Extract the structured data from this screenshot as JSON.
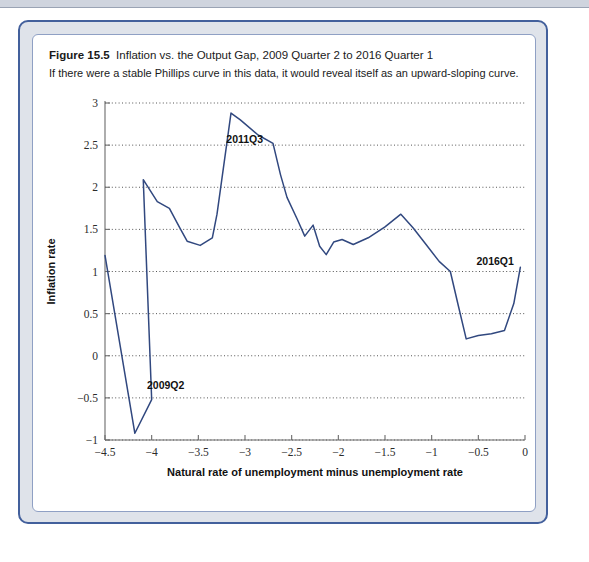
{
  "figure": {
    "number": "Figure 15.5",
    "title": "Inflation vs. the Output Gap, 2009 Quarter 2 to 2016 Quarter 1",
    "subtitle": "If there were a stable Phillips curve in this data, it would reveal itself as an upward-sloping curve."
  },
  "colors": {
    "series": "#31487f",
    "frame_border": "#43609c",
    "panel_background": "#dfe3ea",
    "plot_background": "#ffffff",
    "gridline": "#555555",
    "axis": "#6b6b6b"
  },
  "chart_data": {
    "type": "line",
    "title": "Inflation vs. the Output Gap, 2009 Quarter 2 to 2016 Quarter 1",
    "xlabel": "Natural rate of unemployment minus unemployment rate",
    "ylabel": "Inflation rate",
    "xlim": [
      -4.5,
      0
    ],
    "ylim": [
      -1,
      3
    ],
    "xticks": [
      -4.5,
      -4,
      -3.5,
      -3,
      -2.5,
      -2,
      -1.5,
      -1,
      -0.5,
      0
    ],
    "xticklabels": [
      "−4.5",
      "−4",
      "−3.5",
      "−3",
      "−2.5",
      "−2",
      "−1.5",
      "−1",
      "−0.5",
      "0"
    ],
    "yticks": [
      -1,
      -0.5,
      0,
      0.5,
      1,
      1.5,
      2,
      2.5,
      3
    ],
    "yticklabels": [
      "−1",
      "−0.5",
      "0",
      "0.5",
      "1",
      "1.5",
      "2",
      "2.5",
      "3"
    ],
    "grid": "horizontal",
    "legend": "none",
    "series": [
      {
        "name": "Inflation vs. output gap path",
        "x": [
          -4.5,
          -4.18,
          -4.0,
          -4.09,
          -3.94,
          -3.81,
          -3.7,
          -3.62,
          -3.48,
          -3.35,
          -3.3,
          -3.15,
          -3.05,
          -2.86,
          -2.7,
          -2.62,
          -2.55,
          -2.44,
          -2.36,
          -2.27,
          -2.2,
          -2.13,
          -2.05,
          -1.96,
          -1.84,
          -1.68,
          -1.5,
          -1.33,
          -1.2,
          -1.06,
          -0.92,
          -0.8,
          -0.72,
          -0.63,
          -0.5,
          -0.36,
          -0.22,
          -0.12,
          -0.05
        ],
        "y": [
          1.19,
          -0.92,
          -0.52,
          2.09,
          1.83,
          1.75,
          1.52,
          1.36,
          1.31,
          1.4,
          1.68,
          2.88,
          2.8,
          2.62,
          2.52,
          2.15,
          1.88,
          1.62,
          1.42,
          1.55,
          1.3,
          1.2,
          1.35,
          1.38,
          1.32,
          1.4,
          1.53,
          1.68,
          1.52,
          1.32,
          1.12,
          1.0,
          0.62,
          0.2,
          0.24,
          0.26,
          0.3,
          0.62,
          1.05
        ]
      }
    ],
    "annotations": [
      {
        "text": "2009Q2",
        "x": -4.05,
        "y": -0.4,
        "anchor": "start"
      },
      {
        "text": "2011Q3",
        "x": -3.2,
        "y": 2.52,
        "anchor": "start"
      },
      {
        "text": "2016Q1",
        "x": -0.52,
        "y": 1.08,
        "anchor": "start"
      }
    ]
  }
}
